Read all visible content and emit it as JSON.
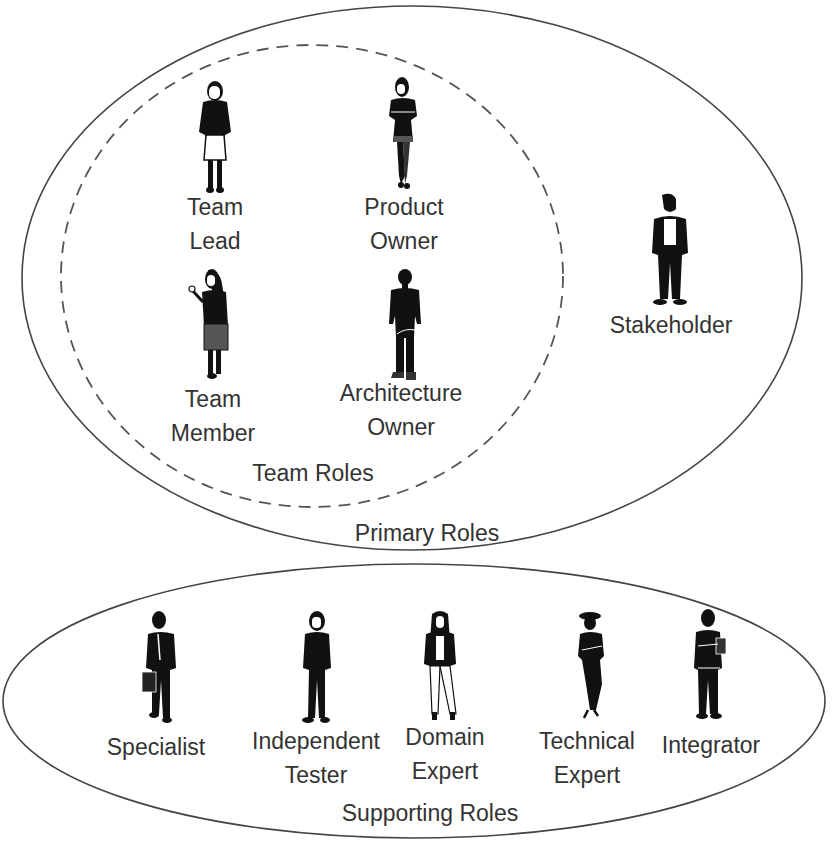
{
  "diagram": {
    "colors": {
      "line": "#444444",
      "silhouette": "#111111",
      "text": "#333333",
      "background": "#ffffff"
    },
    "groups": {
      "primary": {
        "label": "Primary Roles"
      },
      "team": {
        "label": "Team Roles"
      },
      "supporting": {
        "label": "Supporting Roles"
      }
    },
    "team_roles": [
      {
        "line1": "Team",
        "line2": "Lead",
        "icon": "woman-silhouette-icon"
      },
      {
        "line1": "Product",
        "line2": "Owner",
        "icon": "woman-arms-crossed-silhouette-icon"
      },
      {
        "line1": "Team",
        "line2": "Member",
        "icon": "woman-holding-item-silhouette-icon"
      },
      {
        "line1": "Architecture",
        "line2": "Owner",
        "icon": "man-casual-silhouette-icon"
      }
    ],
    "primary_roles": [
      {
        "line1": "Stakeholder",
        "icon": "man-suit-silhouette-icon"
      }
    ],
    "supporting_roles": [
      {
        "line1": "Specialist",
        "line2": "",
        "icon": "man-briefcase-silhouette-icon"
      },
      {
        "line1": "Independent",
        "line2": "Tester",
        "icon": "woman-suit-silhouette-icon"
      },
      {
        "line1": "Domain",
        "line2": "Expert",
        "icon": "woman-jacket-silhouette-icon"
      },
      {
        "line1": "Technical",
        "line2": "Expert",
        "icon": "woman-hat-silhouette-icon"
      },
      {
        "line1": "Integrator",
        "line2": "",
        "icon": "man-tablet-silhouette-icon"
      }
    ]
  }
}
